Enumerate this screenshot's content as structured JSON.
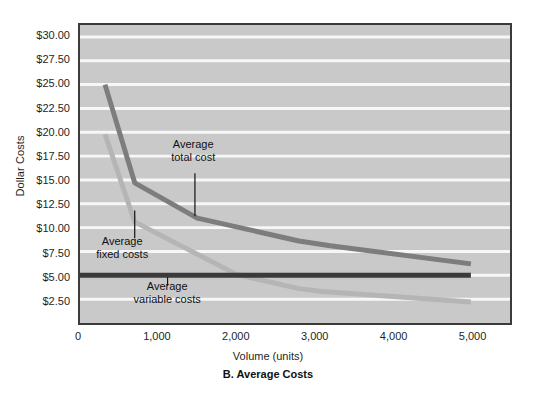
{
  "chart_data": {
    "type": "line",
    "title": "",
    "caption": "B. Average Costs",
    "xlabel": "Volume (units)",
    "ylabel": "Dollar Costs",
    "xlim": [
      0,
      5500
    ],
    "ylim": [
      0,
      31.25
    ],
    "grid": true,
    "legend_position": "none (inline annotations)",
    "x_ticks": [
      {
        "value": 0,
        "label": "0"
      },
      {
        "value": 1000,
        "label": "1,000"
      },
      {
        "value": 2000,
        "label": "2,000"
      },
      {
        "value": 3000,
        "label": "3,000"
      },
      {
        "value": 4000,
        "label": "4,000"
      },
      {
        "value": 5000,
        "label": "5,000"
      }
    ],
    "y_ticks": [
      {
        "value": 2.5,
        "label": "$2.50"
      },
      {
        "value": 5.0,
        "label": "$5.00"
      },
      {
        "value": 7.5,
        "label": "$7.50"
      },
      {
        "value": 10.0,
        "label": "$10.00"
      },
      {
        "value": 12.5,
        "label": "$12.50"
      },
      {
        "value": 15.0,
        "label": "$15.00"
      },
      {
        "value": 17.5,
        "label": "$17.50"
      },
      {
        "value": 20.0,
        "label": "$20.00"
      },
      {
        "value": 22.5,
        "label": "$22.50"
      },
      {
        "value": 25.0,
        "label": "$25.00"
      },
      {
        "value": 27.5,
        "label": "$27.50"
      },
      {
        "value": 30.0,
        "label": "$30.00"
      }
    ],
    "series": [
      {
        "name": "Average total cost",
        "color": "#7d7d7d",
        "width": 5,
        "x": [
          320,
          700,
          1500,
          2800,
          3200,
          5000
        ],
        "y": [
          25.0,
          14.7,
          11.0,
          8.6,
          8.1,
          6.2
        ]
      },
      {
        "name": "Average fixed costs",
        "color": "#b5b5b5",
        "width": 5,
        "x": [
          320,
          700,
          2000,
          2800,
          3100,
          5000
        ],
        "y": [
          19.8,
          10.6,
          5.1,
          3.6,
          3.3,
          2.2
        ]
      },
      {
        "name": "Average variable costs",
        "color": "#3b3b3b",
        "width": 5,
        "x": [
          0,
          5000
        ],
        "y": [
          5.0,
          5.0
        ]
      }
    ],
    "annotations": [
      {
        "id": "average-total-cost",
        "line1": "Average",
        "line2": "total cost",
        "text_x": 1460,
        "text_y": 18.0,
        "leader_x": 1470,
        "leader_y_top": 15.7,
        "leader_y_bottom": 11.2
      },
      {
        "id": "average-fixed-costs",
        "line1": "Average",
        "line2": "fixed costs",
        "text_x": 560,
        "text_y": 8.0,
        "leader_x": 700,
        "leader_y_top": 11.8,
        "leader_y_bottom": 8.9
      },
      {
        "id": "average-variable-costs",
        "line1": "Average",
        "line2": "variable costs",
        "text_x": 1130,
        "text_y": 3.3,
        "leader_x": 1120,
        "leader_y_top": 4.8,
        "leader_y_bottom": 3.9
      }
    ],
    "colors": {
      "plot_background": "#c9c9c9",
      "plot_border": "#3b3b3b",
      "gridline": "#f7f7f7",
      "page_background": "#ffffff",
      "text": "#1f1f1f"
    }
  }
}
